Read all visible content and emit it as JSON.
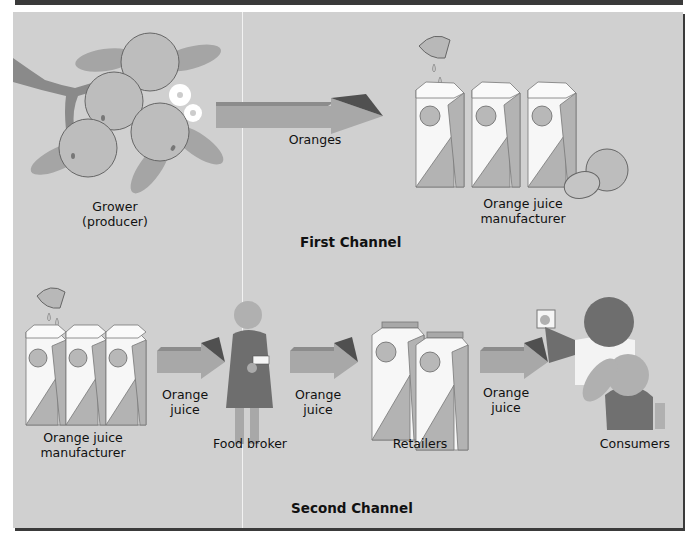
{
  "figure": {
    "first_channel": {
      "title": "First Channel",
      "nodes": [
        {
          "id": "grower",
          "label_line1": "Grower",
          "label_line2": "(producer)",
          "icon": "orange-tree-branch"
        },
        {
          "id": "oj_manufacturer_1",
          "label_line1": "Orange juice",
          "label_line2": "manufacturer",
          "icon": "juice-cartons"
        }
      ],
      "arrows": [
        {
          "from": "grower",
          "to": "oj_manufacturer_1",
          "label": "Oranges"
        }
      ]
    },
    "second_channel": {
      "title": "Second Channel",
      "nodes": [
        {
          "id": "oj_manufacturer_2",
          "label_line1": "Orange juice",
          "label_line2": "manufacturer",
          "icon": "juice-cartons"
        },
        {
          "id": "food_broker",
          "label": "Food broker",
          "icon": "person-with-clipboard"
        },
        {
          "id": "retailers",
          "label": "Retailers",
          "icon": "juice-cartons-pair"
        },
        {
          "id": "consumers",
          "label": "Consumers",
          "icon": "people-drinking"
        }
      ],
      "arrows": [
        {
          "from": "oj_manufacturer_2",
          "to": "food_broker",
          "label_line1": "Orange",
          "label_line2": "juice"
        },
        {
          "from": "food_broker",
          "to": "retailers",
          "label_line1": "Orange",
          "label_line2": "juice"
        },
        {
          "from": "retailers",
          "to": "consumers",
          "label_line1": "Orange",
          "label_line2": "juice"
        }
      ]
    },
    "colors": {
      "background": "#d0d0d0",
      "frame": "#3a3a3a",
      "orange_fill": "#b8b8b8",
      "leaf": "#a5a5a5",
      "branch": "#8a8a8a",
      "arrow_body": "#a8a8a8",
      "arrow_top": "#8c8c8c",
      "arrow_tip": "#505050",
      "carton_white": "#f7f7f7",
      "carton_shade": "#b0b0b0",
      "broker_coat": "#6e6e6e",
      "consumer_dark": "#707070"
    }
  }
}
